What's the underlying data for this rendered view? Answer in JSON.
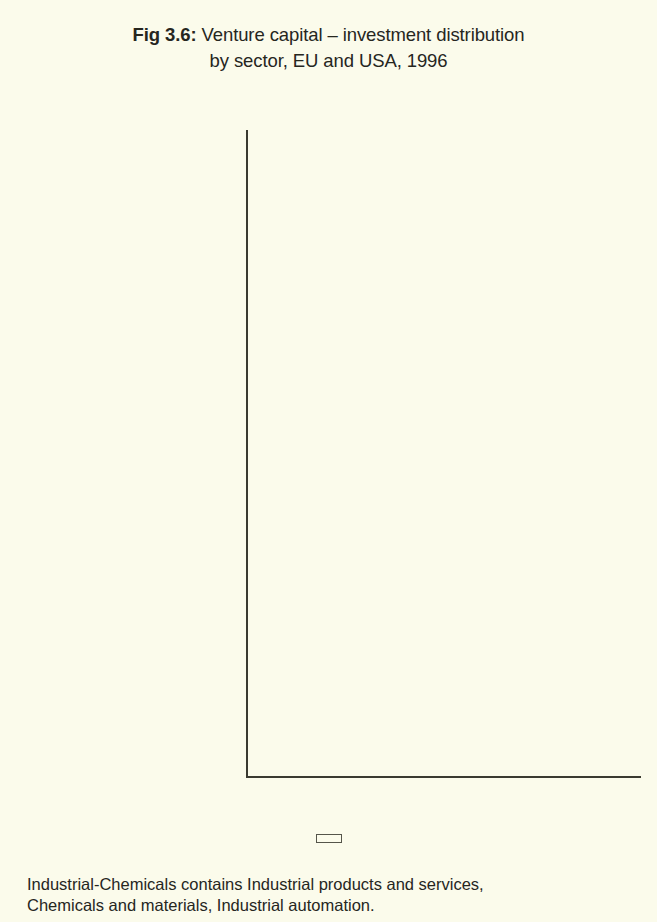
{
  "figure": {
    "fig_label": "Fig 3.6:",
    "title": " Venture capital – investment distribution",
    "title_line2": "by sector, EU and USA, 1996"
  },
  "legend": {
    "items": [
      {
        "label": "EU",
        "color": "#1b2f6b",
        "swatch": "square-swatch"
      },
      {
        "label": "USA",
        "color": "#ea3518",
        "swatch": "square-swatch"
      }
    ]
  },
  "footnote": {
    "line1": "Industrial-Chemicals contains Industrial products and services,",
    "line2": "Chemicals and materials, Industrial automation."
  },
  "axis": {
    "x_ticks": [
      "0%",
      "10%",
      "20%"
    ],
    "x_tick_values": [
      0,
      10,
      20
    ]
  },
  "chart_data": {
    "type": "bar",
    "orientation": "horizontal",
    "title": "Fig 3.6: Venture capital – investment distribution by sector, EU and USA, 1996",
    "xlabel": "",
    "ylabel": "",
    "xlim": [
      0,
      24.5
    ],
    "x_tick_labels": [
      "0%",
      "10%",
      "20%"
    ],
    "grid": "vertical gridlines at 10% and 20%",
    "legend_position": "bottom-center",
    "value_label_format": "0.0%",
    "note": "Mining-Utilities and Other services have no USA bar or value shown",
    "categories": [
      "Mining-Utilities",
      "Construction",
      "Agriculture",
      "Other manufact.",
      "Other services",
      "Financial services",
      "Transportation",
      "Industrial-Chemicals",
      "Consumer related",
      "Energy",
      "Medical-Health",
      "Biotechnology",
      "Other electronics",
      "Computer",
      "Communications"
    ],
    "series": [
      {
        "name": "EU",
        "color": "#1b2f6b",
        "values": [
          3.7,
          3.8,
          1.6,
          9.7,
          11.9,
          6.4,
          2.9,
          20.3,
          18.2,
          1.1,
          3.6,
          2.7,
          4.0,
          5.0,
          4.4
        ],
        "labels": [
          "3.7%",
          "3.8%",
          "1.6%",
          "9.7%",
          "11.9%",
          "6.4%",
          "2.9%",
          "20.3%",
          "18.2%",
          "1.1%",
          "3.6%",
          "2.7%",
          "4.0%",
          "5.0%",
          "4.4%"
        ]
      },
      {
        "name": "USA",
        "color": "#ea3518",
        "values": [
          null,
          0.9,
          0.3,
          2.8,
          null,
          2.1,
          0.2,
          8.1,
          13.3,
          1.7,
          12.6,
          6.8,
          5.0,
          31.9,
          14.1
        ],
        "labels": [
          "",
          "0.9%",
          "0.3%",
          "2.8%",
          "",
          "2.1%",
          "0.2%",
          "8.1%",
          "13.3%",
          "1.7%",
          "12.6%",
          "6.8%",
          "5.0%",
          "31.9%",
          "14.1%"
        ]
      }
    ]
  }
}
